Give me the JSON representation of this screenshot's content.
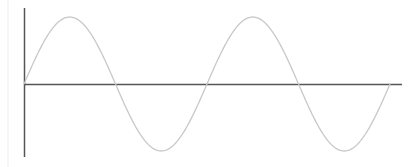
{
  "chart_data": {
    "type": "line",
    "title": "",
    "xlabel": "",
    "ylabel": "",
    "grid": false,
    "legend": null,
    "series": [
      {
        "name": "sine",
        "function": "sin(x)",
        "x_range": [
          0,
          12.566
        ],
        "periods": 2
      }
    ],
    "ylim": [
      -1,
      1
    ],
    "colors": {
      "curve": "#c8c8c8",
      "axes": "#555555",
      "border": "#e4e4e4"
    }
  }
}
